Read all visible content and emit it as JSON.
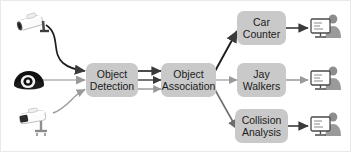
{
  "diagram": {
    "type": "flow-diagram",
    "background_color": "#ffffff",
    "box_fill_color": "#c9c9c9",
    "text_color": "#1b1b1b",
    "arrow_color": "#3a3a3a",
    "thin_arrow_color": "#8f8f8f",
    "inputs": [
      {
        "id": "camera-bullet-top",
        "icon": "bullet-camera-icon",
        "label": "",
        "color": "#ffffff"
      },
      {
        "id": "camera-dome",
        "icon": "dome-camera-icon",
        "label": "",
        "color": "#111111"
      },
      {
        "id": "camera-bullet-bottom",
        "icon": "bullet-camera-icon",
        "label": "",
        "color": "#ffffff"
      }
    ],
    "stages": [
      {
        "id": "object-detection",
        "lines": [
          "Object",
          "Detection"
        ]
      },
      {
        "id": "object-association",
        "lines": [
          "Object",
          "Association"
        ]
      }
    ],
    "outputs": [
      {
        "id": "car-counter",
        "lines": [
          "Car",
          "Counter"
        ],
        "icon": "operator-monitor-icon"
      },
      {
        "id": "jay-walkers",
        "lines": [
          "Jay",
          "Walkers"
        ],
        "icon": "operator-monitor-icon"
      },
      {
        "id": "collision-analysis",
        "lines": [
          "Collision",
          "Analysis"
        ],
        "icon": "operator-monitor-icon"
      }
    ],
    "connections": {
      "cameras_to_detection": 3,
      "detection_to_association": 3,
      "association_to_outputs": 3,
      "outputs_to_operators": 3
    }
  }
}
